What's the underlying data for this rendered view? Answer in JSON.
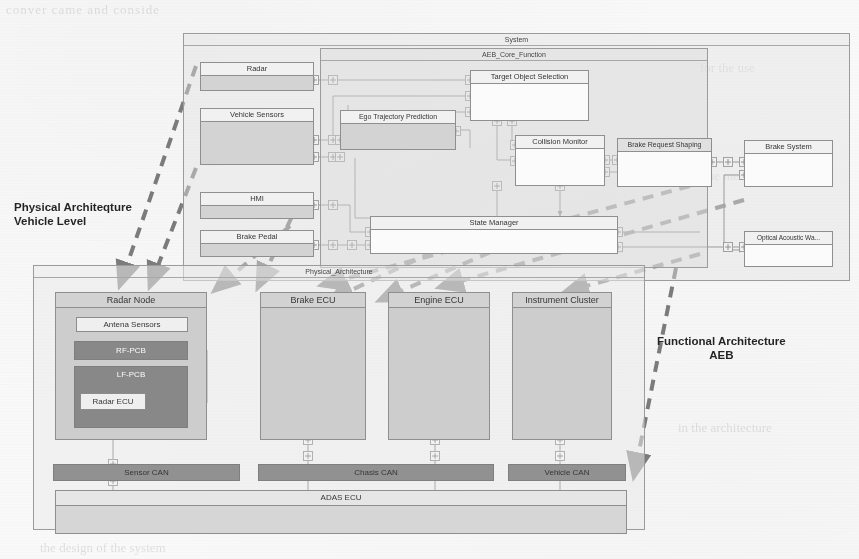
{
  "annotations": {
    "left": {
      "line1": "Physical Architeqture",
      "line2": "Vehicle Level"
    },
    "right": {
      "line1": "Functional Architecture",
      "line2": "AEB"
    }
  },
  "functional": {
    "system_label": "System",
    "core_label": "AEB_Core_Function",
    "external_blocks": [
      {
        "id": "radar",
        "label": "Radar"
      },
      {
        "id": "vsens",
        "label": "Vehicle Sensors"
      },
      {
        "id": "hmi",
        "label": "HMI"
      },
      {
        "id": "bped",
        "label": "Brake Pedal"
      }
    ],
    "core_blocks": [
      {
        "id": "tos",
        "label": "Target Object Selection"
      },
      {
        "id": "etp",
        "label": "Ego Trajectory Prediction"
      },
      {
        "id": "cm",
        "label": "Collision Monitor"
      },
      {
        "id": "brs",
        "label": "Brake Request Shaping"
      },
      {
        "id": "sm",
        "label": "State Manager"
      }
    ],
    "actuator_blocks": [
      {
        "id": "bsys",
        "label": "Brake System"
      },
      {
        "id": "oaw",
        "label": "Optical Acoustic Wa..."
      }
    ]
  },
  "physical": {
    "package_label": "Physical_Architecture",
    "nodes": [
      {
        "id": "radarnode",
        "label": "Radar Node"
      },
      {
        "id": "brakeecu",
        "label": "Brake ECU"
      },
      {
        "id": "engineecu",
        "label": "Engine ECU"
      },
      {
        "id": "cluster",
        "label": "Instrument Cluster"
      }
    ],
    "radar_parts": [
      {
        "id": "antena",
        "label": "Antena Sensors"
      },
      {
        "id": "rfpcb",
        "label": "RF-PCB"
      },
      {
        "id": "lfpcb",
        "label": "LF-PCB"
      },
      {
        "id": "radarecu",
        "label": "Radar ECU"
      }
    ],
    "buses": [
      {
        "id": "sensorcan",
        "label": "Sensor CAN"
      },
      {
        "id": "chasiscan",
        "label": "Chasis CAN"
      },
      {
        "id": "vehiclecan",
        "label": "Vehicle CAN"
      }
    ],
    "adas_label": "ADAS ECU"
  },
  "ghost_text": [
    "conver  came  and  conside",
    "for the  use",
    "of the  method",
    "in the  architecture",
    "the  design  of the  system"
  ],
  "colors": {
    "line": "#7d7d7d",
    "fill_light": "#e4e4e4",
    "fill_mid": "#d5d5d5",
    "fill_dark": "#8e8e8e",
    "trace": "#5d5d5d",
    "text": "#2f2f2f"
  }
}
